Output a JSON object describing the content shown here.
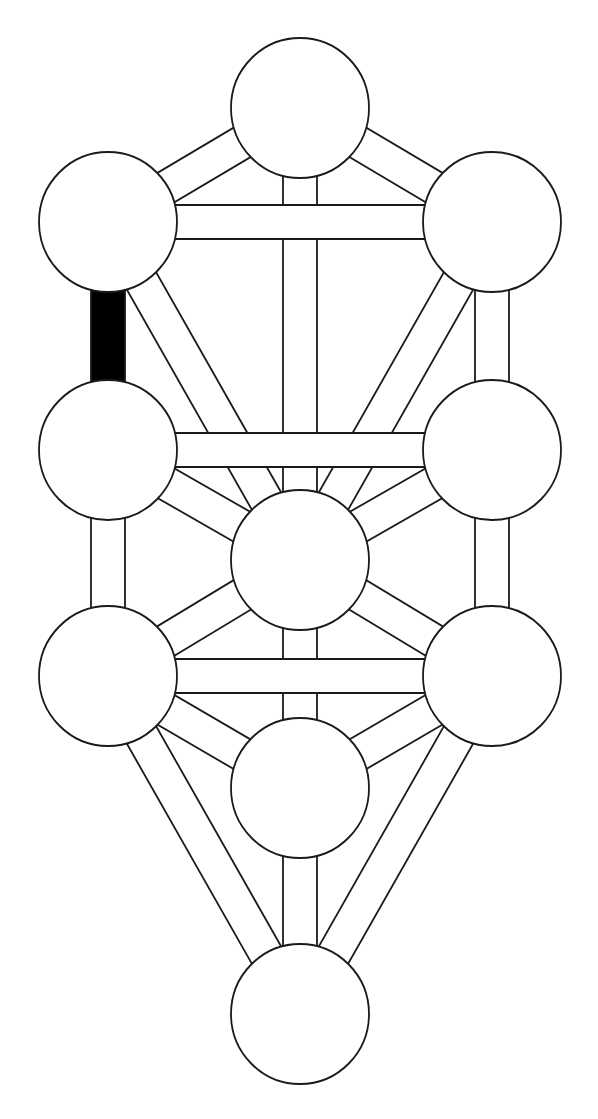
{
  "diagram": {
    "canvas": {
      "width": 598,
      "height": 1119,
      "background": "#ffffff"
    },
    "style": {
      "stroke": "#1a1a1a",
      "fill": "#ffffff",
      "highlight_fill": "#000000",
      "stroke_width": 1.8,
      "path_width": 34
    },
    "nodes": [
      {
        "id": "kether",
        "cx": 300,
        "cy": 108,
        "rx": 69,
        "ry": 70
      },
      {
        "id": "chokmah",
        "cx": 492,
        "cy": 222,
        "rx": 69,
        "ry": 70
      },
      {
        "id": "binah",
        "cx": 108,
        "cy": 222,
        "rx": 69,
        "ry": 70
      },
      {
        "id": "chesed",
        "cx": 492,
        "cy": 450,
        "rx": 69,
        "ry": 70
      },
      {
        "id": "geburah",
        "cx": 108,
        "cy": 450,
        "rx": 69,
        "ry": 70
      },
      {
        "id": "tiphareth",
        "cx": 300,
        "cy": 560,
        "rx": 69,
        "ry": 70
      },
      {
        "id": "netzach",
        "cx": 492,
        "cy": 676,
        "rx": 69,
        "ry": 70
      },
      {
        "id": "hod",
        "cx": 108,
        "cy": 676,
        "rx": 69,
        "ry": 70
      },
      {
        "id": "yesod",
        "cx": 300,
        "cy": 788,
        "rx": 69,
        "ry": 70
      },
      {
        "id": "malkuth",
        "cx": 300,
        "cy": 1014,
        "rx": 69,
        "ry": 70
      }
    ],
    "paths": [
      {
        "from": "kether",
        "to": "tiphareth",
        "highlighted": false,
        "layer": 0
      },
      {
        "from": "tiphareth",
        "to": "yesod",
        "highlighted": false,
        "layer": 0
      },
      {
        "from": "yesod",
        "to": "malkuth",
        "highlighted": false,
        "layer": 0
      },
      {
        "from": "kether",
        "to": "chokmah",
        "highlighted": false,
        "layer": 0
      },
      {
        "from": "kether",
        "to": "binah",
        "highlighted": false,
        "layer": 0
      },
      {
        "from": "chokmah",
        "to": "chesed",
        "highlighted": false,
        "layer": 0
      },
      {
        "from": "binah",
        "to": "geburah",
        "highlighted": true,
        "layer": 0
      },
      {
        "from": "chokmah",
        "to": "tiphareth",
        "highlighted": false,
        "layer": 0
      },
      {
        "from": "binah",
        "to": "tiphareth",
        "highlighted": false,
        "layer": 0
      },
      {
        "from": "chesed",
        "to": "tiphareth",
        "highlighted": false,
        "layer": 0
      },
      {
        "from": "geburah",
        "to": "tiphareth",
        "highlighted": false,
        "layer": 0
      },
      {
        "from": "chesed",
        "to": "netzach",
        "highlighted": false,
        "layer": 0
      },
      {
        "from": "geburah",
        "to": "hod",
        "highlighted": false,
        "layer": 0
      },
      {
        "from": "tiphareth",
        "to": "netzach",
        "highlighted": false,
        "layer": 0
      },
      {
        "from": "tiphareth",
        "to": "hod",
        "highlighted": false,
        "layer": 0
      },
      {
        "from": "netzach",
        "to": "yesod",
        "highlighted": false,
        "layer": 0
      },
      {
        "from": "hod",
        "to": "yesod",
        "highlighted": false,
        "layer": 0
      },
      {
        "from": "netzach",
        "to": "malkuth",
        "highlighted": false,
        "layer": 0
      },
      {
        "from": "hod",
        "to": "malkuth",
        "highlighted": false,
        "layer": 0
      },
      {
        "from": "chokmah",
        "to": "binah",
        "highlighted": false,
        "layer": 1
      },
      {
        "from": "chesed",
        "to": "geburah",
        "highlighted": false,
        "layer": 1
      },
      {
        "from": "netzach",
        "to": "hod",
        "highlighted": false,
        "layer": 1
      }
    ]
  }
}
